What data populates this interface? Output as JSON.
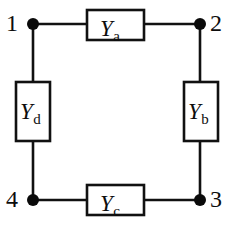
{
  "figure": {
    "type": "circuit-diagram",
    "background_color": "#ffffff",
    "line_color": "#111111",
    "text_color": "#0d0d0d"
  },
  "elements": [
    {
      "id": "Ya",
      "symbol": "Y",
      "subscript": "a",
      "orientation": "horizontal",
      "position": "top",
      "between_nodes": [
        "1",
        "2"
      ],
      "box": {
        "x": 87,
        "y": 10,
        "w": 57,
        "h": 30
      },
      "label": {
        "x": 100,
        "y": 17
      }
    },
    {
      "id": "Yb",
      "symbol": "Y",
      "subscript": "b",
      "orientation": "vertical",
      "position": "right",
      "between_nodes": [
        "2",
        "3"
      ],
      "box": {
        "x": 184,
        "y": 82,
        "w": 34,
        "h": 59
      },
      "label": {
        "x": 188,
        "y": 100
      }
    },
    {
      "id": "Yc",
      "symbol": "Y",
      "subscript": "c",
      "orientation": "horizontal",
      "position": "bottom",
      "between_nodes": [
        "4",
        "3"
      ],
      "box": {
        "x": 87,
        "y": 185,
        "w": 57,
        "h": 30
      },
      "label": {
        "x": 100,
        "y": 192
      }
    },
    {
      "id": "Yd",
      "symbol": "Y",
      "subscript": "d",
      "orientation": "vertical",
      "position": "left",
      "between_nodes": [
        "1",
        "4"
      ],
      "box": {
        "x": 16,
        "y": 82,
        "w": 34,
        "h": 59
      },
      "label": {
        "x": 20,
        "y": 100
      }
    }
  ],
  "nodes": [
    {
      "id": "1",
      "label": "1",
      "corner": "top-left",
      "dot": {
        "cx": 33,
        "cy": 24
      },
      "label_pos": {
        "x": 6,
        "y": 11
      }
    },
    {
      "id": "2",
      "label": "2",
      "corner": "top-right",
      "dot": {
        "cx": 200,
        "cy": 24
      },
      "label_pos": {
        "x": 210,
        "y": 11
      }
    },
    {
      "id": "3",
      "label": "3",
      "corner": "bottom-right",
      "dot": {
        "cx": 200,
        "cy": 200
      },
      "label_pos": {
        "x": 210,
        "y": 187
      }
    },
    {
      "id": "4",
      "label": "4",
      "corner": "bottom-left",
      "dot": {
        "cx": 33,
        "cy": 200
      },
      "label_pos": {
        "x": 6,
        "y": 187
      }
    }
  ],
  "node_dot_radius": 6,
  "wires": [
    {
      "name": "wire-node1-to-Ya",
      "x1": 33,
      "y1": 24,
      "x2": 87,
      "y2": 24
    },
    {
      "name": "wire-Ya-to-node2",
      "x1": 144,
      "y1": 24,
      "x2": 200,
      "y2": 24
    },
    {
      "name": "wire-node2-to-Yb",
      "x1": 200,
      "y1": 24,
      "x2": 200,
      "y2": 82
    },
    {
      "name": "wire-Yb-to-node3",
      "x1": 200,
      "y1": 141,
      "x2": 200,
      "y2": 200
    },
    {
      "name": "wire-node3-to-Yc",
      "x1": 200,
      "y1": 200,
      "x2": 144,
      "y2": 200
    },
    {
      "name": "wire-Yc-to-node4",
      "x1": 87,
      "y1": 200,
      "x2": 33,
      "y2": 200
    },
    {
      "name": "wire-node4-to-Yd",
      "x1": 33,
      "y1": 200,
      "x2": 33,
      "y2": 141
    },
    {
      "name": "wire-Yd-to-node1",
      "x1": 33,
      "y1": 82,
      "x2": 33,
      "y2": 24
    }
  ]
}
